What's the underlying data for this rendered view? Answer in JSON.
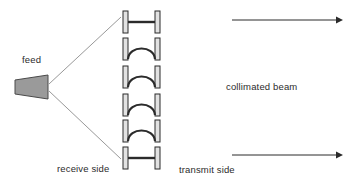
{
  "diagram": {
    "background_color": "#ffffff",
    "stroke_color": "#2b2b2b",
    "ray_color": "#8c8c8c",
    "element_fill": "#e2e2e2",
    "feed_fill": "#9a9a9a",
    "labels": {
      "feed": "feed",
      "receive_side": "receive side",
      "transmit_side": "transmit side",
      "collimated_beam": "collimated beam"
    },
    "feed_horn": {
      "name": "feed-horn",
      "shape": "trapezoid",
      "points": "15,80 15,94 48,99 48,75",
      "fill": "#9a9a9a",
      "stroke": "#4a4a4a"
    },
    "rays": [
      {
        "name": "ray-upper",
        "x1": 49,
        "y1": 84,
        "x2": 121,
        "y2": 17
      },
      {
        "name": "ray-lower",
        "x1": 49,
        "y1": 91,
        "x2": 121,
        "y2": 159
      }
    ],
    "elements": [
      {
        "name": "element-1",
        "type": "flat",
        "y": 22,
        "label": "flat element top"
      },
      {
        "name": "element-2",
        "type": "curved",
        "y": 48,
        "label": "curved element 1"
      },
      {
        "name": "element-3",
        "type": "curved",
        "y": 76,
        "label": "curved element 2"
      },
      {
        "name": "element-4",
        "type": "curved",
        "y": 104,
        "label": "curved element 3"
      },
      {
        "name": "element-5",
        "type": "curved",
        "y": 130,
        "label": "curved element 4"
      },
      {
        "name": "element-6",
        "type": "flat",
        "y": 158,
        "label": "flat element bottom"
      }
    ],
    "element_geometry": {
      "post_left_x": 123,
      "post_right_x": 155,
      "post_width": 5,
      "post_height": 22,
      "bar_left": 128,
      "bar_right": 155,
      "arc_rise": 16
    },
    "arrows": [
      {
        "name": "arrow-top",
        "x1": 232,
        "y1": 20,
        "x2": 342,
        "y2": 20
      },
      {
        "name": "arrow-bottom",
        "x1": 232,
        "y1": 155,
        "x2": 342,
        "y2": 155
      }
    ]
  }
}
